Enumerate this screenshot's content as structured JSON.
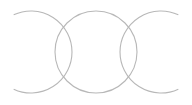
{
  "diagram": {
    "type": "interlocking-circles",
    "stroke_color": "#b8b8b8",
    "background": "#ffffff",
    "circles": [
      {
        "name": "left-ring",
        "cx": 31,
        "cy": 52,
        "r": 41,
        "kind": "arc-open-left"
      },
      {
        "name": "center-ring",
        "cx": 96,
        "cy": 52,
        "r": 41,
        "kind": "full"
      },
      {
        "name": "right-ring",
        "cx": 161,
        "cy": 52,
        "r": 41,
        "kind": "arc-open-right"
      }
    ]
  }
}
